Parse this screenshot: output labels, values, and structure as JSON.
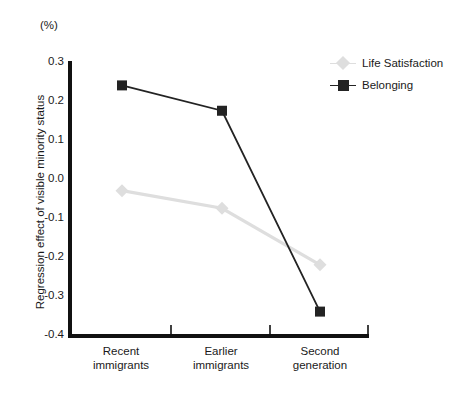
{
  "chart_data": {
    "type": "line",
    "title": "",
    "unit_label": "(%)",
    "ylabel": "Regression effect of visible minority status",
    "xlabel": "",
    "categories": [
      "Recent\nimmigrants",
      "Earlier\nimmigrants",
      "Second\ngeneration"
    ],
    "series": [
      {
        "name": "Life Satisfaction",
        "color": "#dedede",
        "marker": "diamond",
        "values": [
          -0.03,
          -0.075,
          -0.22
        ]
      },
      {
        "name": "Belonging",
        "color": "#232323",
        "marker": "square",
        "values": [
          0.24,
          0.175,
          -0.34
        ]
      }
    ],
    "ylim": [
      -0.4,
      0.3
    ],
    "yticks": [
      "0.3",
      "0.2",
      "0.1",
      "0.0",
      "-0.1",
      "-0.2",
      "-0.3",
      "-0.4"
    ],
    "ytick_values": [
      0.3,
      0.2,
      0.1,
      0.0,
      -0.1,
      -0.2,
      -0.3,
      -0.4
    ],
    "grid": false,
    "legend_position": "top-right"
  },
  "legend": {
    "items": [
      {
        "label": "Life Satisfaction"
      },
      {
        "label": "Belonging"
      }
    ]
  },
  "axes": {
    "axis_color": "#111111"
  }
}
